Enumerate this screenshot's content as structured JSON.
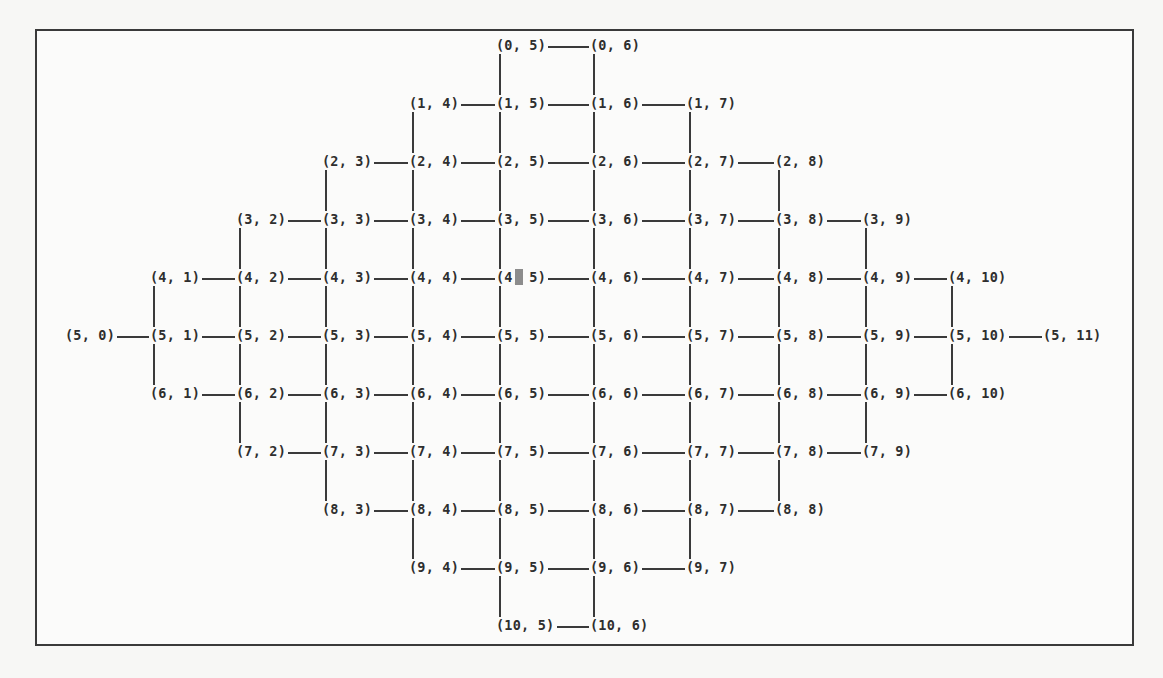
{
  "diagram": {
    "type": "grid-graph-terminal-output",
    "layout": {
      "row_y": [
        45,
        103,
        161,
        219,
        277,
        335,
        393,
        451,
        509,
        567,
        625
      ],
      "col_x": [
        65,
        150,
        236,
        322,
        409,
        496,
        590,
        686,
        775,
        862,
        948,
        1043
      ],
      "char_width": 8.5
    },
    "rows": [
      {
        "row": 0,
        "cols": [
          5,
          6
        ]
      },
      {
        "row": 1,
        "cols": [
          4,
          5,
          6,
          7
        ]
      },
      {
        "row": 2,
        "cols": [
          3,
          4,
          5,
          6,
          7,
          8
        ]
      },
      {
        "row": 3,
        "cols": [
          2,
          3,
          4,
          5,
          6,
          7,
          8,
          9
        ]
      },
      {
        "row": 4,
        "cols": [
          1,
          2,
          3,
          4,
          5,
          6,
          7,
          8,
          9,
          10
        ]
      },
      {
        "row": 5,
        "cols": [
          0,
          1,
          2,
          3,
          4,
          5,
          6,
          7,
          8,
          9,
          10,
          11
        ]
      },
      {
        "row": 6,
        "cols": [
          1,
          2,
          3,
          4,
          5,
          6,
          7,
          8,
          9,
          10
        ]
      },
      {
        "row": 7,
        "cols": [
          2,
          3,
          4,
          5,
          6,
          7,
          8,
          9
        ]
      },
      {
        "row": 8,
        "cols": [
          3,
          4,
          5,
          6,
          7,
          8
        ]
      },
      {
        "row": 9,
        "cols": [
          4,
          5,
          6,
          7
        ]
      },
      {
        "row": 10,
        "cols": [
          5,
          6
        ]
      }
    ],
    "vertical_edges_down_from": [
      {
        "row": 0,
        "cols": [
          5,
          6
        ]
      },
      {
        "row": 1,
        "cols": [
          4,
          5,
          6,
          7
        ]
      },
      {
        "row": 2,
        "cols": [
          3,
          4,
          5,
          6,
          7,
          8
        ]
      },
      {
        "row": 3,
        "cols": [
          2,
          3,
          4,
          5,
          6,
          7,
          8,
          9
        ]
      },
      {
        "row": 4,
        "cols": [
          1,
          2,
          3,
          4,
          5,
          6,
          7,
          8,
          9,
          10
        ]
      },
      {
        "row": 5,
        "cols": [
          1,
          2,
          3,
          4,
          5,
          6,
          7,
          8,
          9,
          10
        ]
      },
      {
        "row": 6,
        "cols": [
          2,
          3,
          4,
          5,
          6,
          7,
          8,
          9
        ]
      },
      {
        "row": 7,
        "cols": [
          3,
          4,
          5,
          6,
          7,
          8
        ]
      },
      {
        "row": 8,
        "cols": [
          4,
          5,
          6,
          7
        ]
      },
      {
        "row": 9,
        "cols": [
          5,
          6
        ]
      }
    ],
    "cursor": {
      "row": 4,
      "col": 5,
      "char_index": 2
    }
  }
}
